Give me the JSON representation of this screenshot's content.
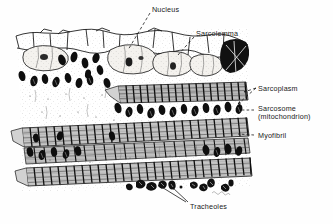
{
  "figure": {
    "style": "black-and-white stippled pen-and-ink scientific illustration",
    "background_color": "#fefefe",
    "ink_color": "#101010",
    "signature": "artist signature (illegible)"
  },
  "labels": [
    {
      "id": "nucleus",
      "text": "Nucleus",
      "text2": "",
      "x": 152,
      "y": 6,
      "leader": "dashed-line"
    },
    {
      "id": "sarcolemma",
      "text": "Sarcolemma",
      "text2": "",
      "x": 196,
      "y": 30,
      "leader": "dashed-line"
    },
    {
      "id": "sarcoplasm",
      "text": "Sarcoplasm",
      "text2": "",
      "x": 258,
      "y": 85,
      "leader": "forked-arrow"
    },
    {
      "id": "sarcosome",
      "text": "Sarcosome",
      "text2": "(mitochondrion)",
      "x": 258,
      "y": 105,
      "leader": "dashed-line"
    },
    {
      "id": "myofibril",
      "text": "Myofibril",
      "text2": "",
      "x": 258,
      "y": 132,
      "leader": "dashed-line"
    },
    {
      "id": "tracheoles",
      "text": "Tracheoles",
      "text2": "",
      "x": 190,
      "y": 203,
      "leader": "double-arrow"
    }
  ],
  "structures": {
    "sarcolemma_layer": {
      "name": "Sarcolemma with nuclei",
      "count_nuclei": 4
    },
    "myofibril_bands": {
      "name": "Striated myofibrils",
      "count": 4,
      "striation": "cross-striated A and I bands"
    },
    "sarcosomes": {
      "name": "Sarcosomes (mitochondria)",
      "appearance": "dark oval bodies between myofibrils"
    },
    "tracheoles": {
      "name": "Tracheoles",
      "appearance": "small dark indented bodies at lower margin"
    }
  }
}
